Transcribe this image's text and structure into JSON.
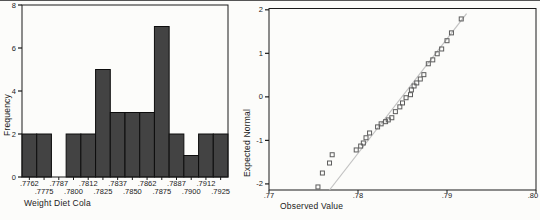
{
  "window": {
    "background": "#fcfcfa",
    "border_color": "#555555"
  },
  "colors": {
    "axis": "#1a1a1a",
    "text": "#1b1b1b",
    "bar_fill": "#434343",
    "bar_border": "#0d0d0d",
    "qq_marker": "#5c5c5c",
    "qq_line": "#c2c2c2"
  },
  "chart_data": [
    {
      "type": "bar",
      "chart": "histogram",
      "title": "",
      "xlabel": "Weight Diet Cola",
      "ylabel": "Frequency",
      "categories": [
        ".7762",
        ".7775",
        ".7787",
        ".7800",
        ".7812",
        ".7825",
        ".7837",
        ".7850",
        ".7862",
        ".7875",
        ".7887",
        ".7900",
        ".7912",
        ".7925"
      ],
      "values": [
        2,
        2,
        0,
        2,
        2,
        5,
        3,
        3,
        3,
        7,
        2,
        1,
        2,
        2
      ],
      "n_total": 36,
      "ylim": [
        0,
        8
      ],
      "y_ticks": [
        0,
        2,
        4,
        6,
        8
      ],
      "grid": false,
      "x_tick_label_layout": "alternating-two-rows"
    },
    {
      "type": "scatter",
      "chart": "normal-qq-plot",
      "title": "",
      "xlabel": "Observed Value",
      "ylabel": "Expected Normal",
      "xlim": [
        0.77,
        0.8
      ],
      "x_ticks": [
        {
          "value": 0.77,
          "label": ".77"
        },
        {
          "value": 0.78,
          "label": ".78"
        },
        {
          "value": 0.79,
          "label": ".79"
        },
        {
          "value": 0.8,
          "label": ".80"
        }
      ],
      "ylim": [
        -2.14,
        2.03
      ],
      "y_ticks": [
        {
          "value": 2,
          "label": "2"
        },
        {
          "value": 1,
          "label": "1"
        },
        {
          "value": 0,
          "label": "0"
        },
        {
          "value": -1,
          "label": "-1"
        },
        {
          "value": -2,
          "label": "-2"
        }
      ],
      "marker": "open-square",
      "grid": false,
      "points": [
        [
          0.7755,
          -2.07
        ],
        [
          0.776,
          -1.75
        ],
        [
          0.7768,
          -1.52
        ],
        [
          0.7771,
          -1.33
        ],
        [
          0.7798,
          -1.22
        ],
        [
          0.7803,
          -1.13
        ],
        [
          0.7806,
          -1.06
        ],
        [
          0.7809,
          -0.94
        ],
        [
          0.7813,
          -0.83
        ],
        [
          0.7822,
          -0.69
        ],
        [
          0.7826,
          -0.62
        ],
        [
          0.7831,
          -0.57
        ],
        [
          0.7834,
          -0.53
        ],
        [
          0.7838,
          -0.48
        ],
        [
          0.7842,
          -0.34
        ],
        [
          0.7847,
          -0.23
        ],
        [
          0.785,
          -0.14
        ],
        [
          0.7854,
          -0.02
        ],
        [
          0.7859,
          0.05
        ],
        [
          0.786,
          0.16
        ],
        [
          0.7863,
          0.25
        ],
        [
          0.7866,
          0.32
        ],
        [
          0.787,
          0.41
        ],
        [
          0.7874,
          0.51
        ],
        [
          0.7879,
          0.76
        ],
        [
          0.7884,
          0.85
        ],
        [
          0.7889,
          0.99
        ],
        [
          0.7894,
          1.1
        ],
        [
          0.79,
          1.29
        ],
        [
          0.7905,
          1.47
        ],
        [
          0.7916,
          1.79
        ]
      ],
      "reference_line": {
        "x1": 0.7768,
        "y1": -2.14,
        "x2": 0.7922,
        "y2": 1.91
      }
    }
  ]
}
